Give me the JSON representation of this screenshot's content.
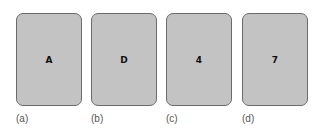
{
  "cards": [
    {
      "face": "A",
      "caption": "(a)"
    },
    {
      "face": "D",
      "caption": "(b)"
    },
    {
      "face": "4",
      "caption": "(c)"
    },
    {
      "face": "7",
      "caption": "(d)"
    }
  ],
  "colors": {
    "card_fill": "#c3c3c3",
    "card_border": "#6b6b6b",
    "text": "#111111",
    "caption": "#555555"
  }
}
